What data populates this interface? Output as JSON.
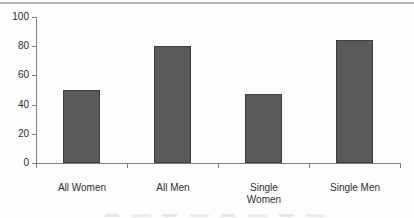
{
  "chart_data": {
    "type": "bar",
    "categories": [
      "All Women",
      "All Men",
      "Single Women",
      "Single Men"
    ],
    "values": [
      50,
      80,
      47,
      84
    ],
    "tick_label_lines": [
      [
        "All Women"
      ],
      [
        "All Men"
      ],
      [
        "Single",
        "Women"
      ],
      [
        "Single Men"
      ]
    ],
    "title": "",
    "xlabel": "",
    "ylabel": "",
    "ylim": [
      0,
      100
    ],
    "yticks": [
      0,
      20,
      40,
      60,
      80,
      100
    ],
    "grid": false,
    "legend": "none",
    "colors": {
      "bar_fill": "#5a5a5a",
      "bar_border": "#3e3e3e",
      "axis": "#7f7f7f",
      "text": "#2f2f2f",
      "top_rule": "#b5b5b5",
      "background": "#fdfdfd"
    }
  }
}
